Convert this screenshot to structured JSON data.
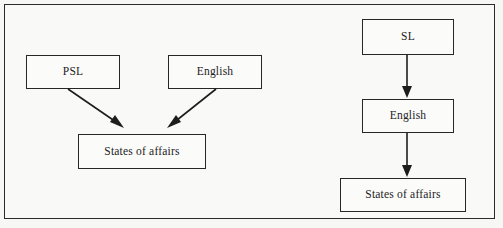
{
  "figure": {
    "kind": "diagram",
    "frame_border_color": "#2b2b2b",
    "background_color": "#f7f7f6",
    "text_color": "#1c1c1c",
    "arrow_color": "#1d1d1d"
  },
  "left_diagram": {
    "name": "parallel-mapping-diagram",
    "nodes": [
      {
        "id": "psl",
        "label": "PSL"
      },
      {
        "id": "english",
        "label": "English"
      },
      {
        "id": "states_affairs",
        "label": "States of affairs"
      }
    ],
    "edges": [
      {
        "from": "psl",
        "to": "states_affairs",
        "direction": "down-right",
        "style": "solid-arrow"
      },
      {
        "from": "english",
        "to": "states_affairs",
        "direction": "down-left",
        "style": "solid-arrow"
      }
    ]
  },
  "right_diagram": {
    "name": "sequential-mapping-diagram",
    "nodes": [
      {
        "id": "sl",
        "label": "SL"
      },
      {
        "id": "english",
        "label": "English"
      },
      {
        "id": "states_affairs",
        "label": "States of affairs"
      }
    ],
    "edges": [
      {
        "from": "sl",
        "to": "english",
        "direction": "down",
        "style": "solid-arrow"
      },
      {
        "from": "english",
        "to": "states_affairs",
        "direction": "down",
        "style": "solid-arrow"
      }
    ]
  }
}
